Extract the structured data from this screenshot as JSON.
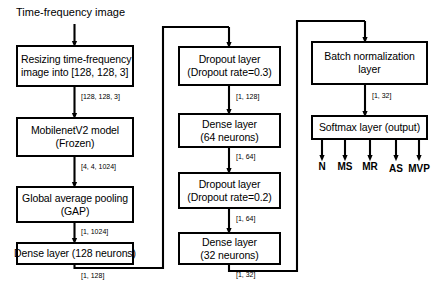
{
  "diagram": {
    "title_text": "Time-frequency image",
    "columns": [
      {
        "name": "preprocessing-and-backbone",
        "nodes": [
          {
            "id": "resize",
            "lines": [
              "Resizing time-frequency",
              "image into [128, 128, 3]"
            ]
          },
          {
            "id": "mobilenet",
            "lines": [
              "MobilenetV2 model",
              "(Frozen)"
            ]
          },
          {
            "id": "gap",
            "lines": [
              "Global average pooling",
              "(GAP)"
            ]
          },
          {
            "id": "dense128",
            "lines": [
              "Dense layer (128 neurons)"
            ]
          }
        ],
        "edge_labels": [
          "[128, 128, 3]",
          "[4, 4, 1024]",
          "[1, 1024]",
          "[1, 128]"
        ]
      },
      {
        "name": "dropout-dense-stack",
        "nodes": [
          {
            "id": "dropout03",
            "lines": [
              "Dropout layer",
              "(Dropout rate=0.3)"
            ]
          },
          {
            "id": "dense64",
            "lines": [
              "Dense layer",
              "(64 neurons)"
            ]
          },
          {
            "id": "dropout02",
            "lines": [
              "Dropout layer",
              "(Dropout rate=0.2)"
            ]
          },
          {
            "id": "dense32",
            "lines": [
              "Dense layer",
              "(32 neurons)"
            ]
          }
        ],
        "edge_labels": [
          "[1, 128]",
          "[1, 64]",
          "[1, 64]",
          "[1, 32]"
        ]
      },
      {
        "name": "normalization-and-output",
        "nodes": [
          {
            "id": "batchnorm",
            "lines": [
              "Batch normalization",
              "layer"
            ]
          },
          {
            "id": "softmax",
            "lines": [
              "Softmax layer (output)"
            ]
          }
        ],
        "edge_labels": [
          "[1, 32]"
        ]
      }
    ],
    "outputs": [
      "N",
      "MS",
      "MR",
      "AS",
      "MVP"
    ],
    "colors": {
      "stroke": "#000000",
      "background": "#ffffff",
      "text": "#000000"
    }
  }
}
